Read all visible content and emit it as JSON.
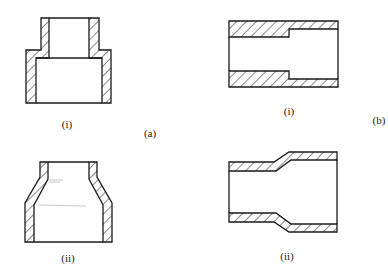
{
  "figure": {
    "colors": {
      "line": "#1a1a1a",
      "hatch": "#1a1a1a",
      "background": "#ffffff",
      "label": "#222222"
    },
    "groups": [
      {
        "id": "a",
        "label": "(a)",
        "orientation": "vertical",
        "parts": [
          {
            "id": "a-i",
            "label": "(i)",
            "type": "stepped-reducer"
          },
          {
            "id": "a-ii",
            "label": "(ii)",
            "type": "conical-reducer"
          }
        ]
      },
      {
        "id": "b",
        "label": "(b)",
        "orientation": "horizontal",
        "parts": [
          {
            "id": "b-i",
            "label": "(i)",
            "type": "stepped-bore-reducer"
          },
          {
            "id": "b-ii",
            "label": "(ii)",
            "type": "swaged-tube-reducer"
          }
        ]
      }
    ]
  }
}
